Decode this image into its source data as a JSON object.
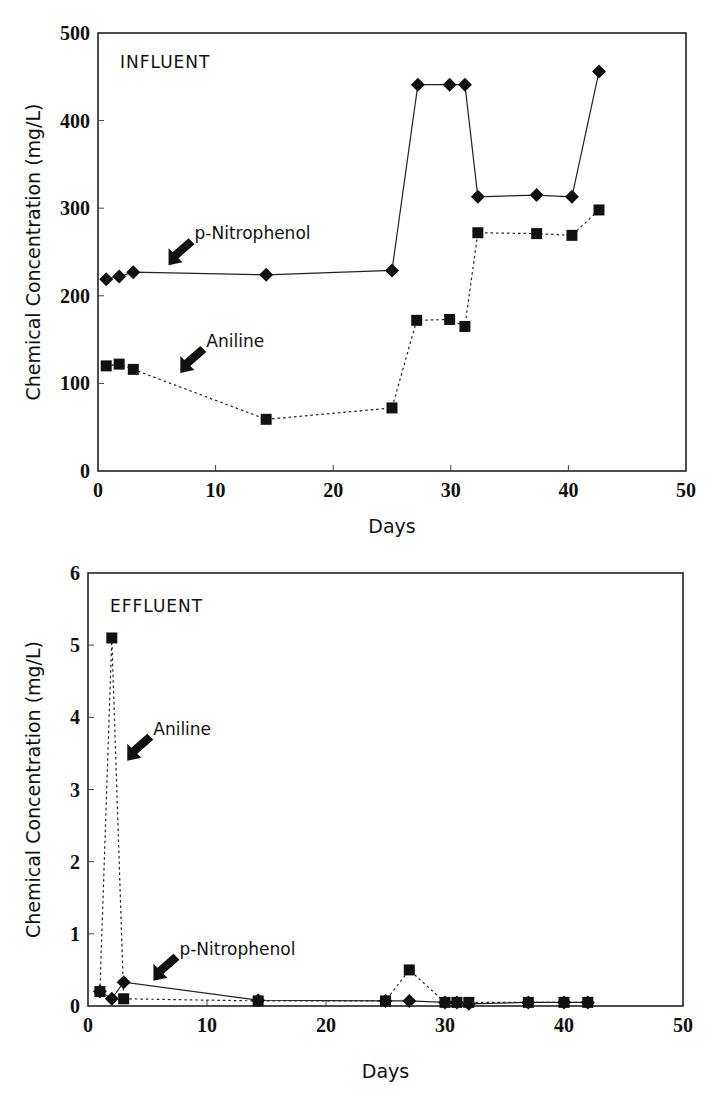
{
  "chart_data": [
    {
      "type": "line",
      "panel_label": "INFLUENT",
      "xlabel": "Days",
      "ylabel": "Chemical Concentration (mg/L)",
      "xlim": [
        0,
        50
      ],
      "ylim": [
        0,
        500
      ],
      "xticks": [
        0,
        10,
        20,
        30,
        40,
        50
      ],
      "yticks": [
        0,
        100,
        200,
        300,
        400,
        500
      ],
      "grid": false,
      "legend": "inline arrow annotations",
      "series": [
        {
          "name": "p-Nitrophenol",
          "marker": "diamond",
          "line": "solid",
          "x": [
            0.7,
            1.8,
            3.0,
            14.3,
            25.0,
            27.2,
            29.9,
            31.2,
            32.3,
            37.3,
            40.3,
            42.6
          ],
          "y": [
            219,
            222,
            227,
            224,
            229,
            441,
            441,
            441,
            313,
            315,
            313,
            456
          ]
        },
        {
          "name": "Aniline",
          "marker": "square",
          "line": "dotted",
          "x": [
            0.7,
            1.8,
            3.0,
            14.3,
            25.0,
            27.1,
            29.9,
            31.2,
            32.3,
            37.3,
            40.3,
            42.6
          ],
          "y": [
            120,
            122,
            116,
            59,
            72,
            172,
            173,
            165,
            272,
            271,
            269,
            298
          ]
        }
      ],
      "annotations": [
        {
          "text": "p-Nitrophenol",
          "arrow_to": [
            6,
            235
          ]
        },
        {
          "text": "Aniline",
          "arrow_to": [
            7,
            112
          ]
        }
      ]
    },
    {
      "type": "line",
      "panel_label": "EFFLUENT",
      "xlabel": "Days",
      "ylabel": "Chemical Concentration (mg/L)",
      "xlim": [
        0,
        50
      ],
      "ylim": [
        0,
        6
      ],
      "xticks": [
        0,
        10,
        20,
        30,
        40,
        50
      ],
      "yticks": [
        0,
        1,
        2,
        3,
        4,
        5,
        6
      ],
      "grid": false,
      "legend": "inline arrow annotations",
      "series": [
        {
          "name": "Aniline",
          "marker": "square",
          "line": "dotted",
          "x": [
            1.0,
            2.0,
            3.0,
            14.3,
            25.0,
            27.0,
            30.0,
            31.0,
            32.0,
            37.0,
            40.0,
            42.0
          ],
          "y": [
            0.2,
            5.1,
            0.1,
            0.07,
            0.07,
            0.5,
            0.05,
            0.05,
            0.05,
            0.05,
            0.05,
            0.05
          ]
        },
        {
          "name": "p-Nitrophenol",
          "marker": "diamond",
          "line": "solid",
          "x": [
            1.0,
            2.0,
            3.0,
            14.3,
            25.0,
            27.0,
            30.0,
            31.0,
            32.0,
            37.0,
            40.0,
            42.0
          ],
          "y": [
            0.2,
            0.1,
            0.33,
            0.08,
            0.07,
            0.07,
            0.05,
            0.05,
            0.03,
            0.05,
            0.05,
            0.05
          ]
        }
      ],
      "annotations": [
        {
          "text": "Aniline",
          "arrow_to": [
            3.3,
            3.4
          ]
        },
        {
          "text": "p-Nitrophenol",
          "arrow_to": [
            5.5,
            0.35
          ]
        }
      ]
    }
  ],
  "labels": {
    "top_panel": "INFLUENT",
    "bottom_panel": "EFFLUENT",
    "xlabel": "Days",
    "ylabel": "Chemical Concentration (mg/L)",
    "pnp": "p-Nitrophenol",
    "aniline": "Aniline"
  }
}
